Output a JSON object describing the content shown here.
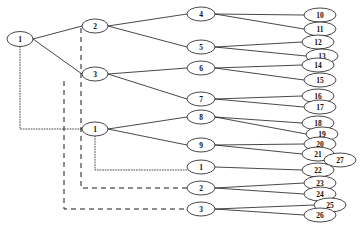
{
  "diagram": {
    "node_shape": "ellipse",
    "line_color": "#1a1a1a",
    "background": "#ffffff",
    "nodes": [
      {
        "id": "n1",
        "label": "1",
        "x": 20,
        "y": 39,
        "rx": 13,
        "ry": 7.5
      },
      {
        "id": "n2",
        "label": "2",
        "x": 95,
        "y": 26,
        "rx": 13,
        "ry": 7.0
      },
      {
        "id": "n3",
        "label": "3",
        "x": 95,
        "y": 74,
        "rx": 13,
        "ry": 7.0
      },
      {
        "id": "n1b",
        "label": "1",
        "x": 95,
        "y": 129,
        "rx": 13,
        "ry": 7.0
      },
      {
        "id": "n4",
        "label": "4",
        "x": 201,
        "y": 14,
        "rx": 14,
        "ry": 7.0
      },
      {
        "id": "n5",
        "label": "5",
        "x": 201,
        "y": 47,
        "rx": 14,
        "ry": 7.0
      },
      {
        "id": "n6",
        "label": "6",
        "x": 201,
        "y": 68,
        "rx": 14,
        "ry": 7.0
      },
      {
        "id": "n7",
        "label": "7",
        "x": 201,
        "y": 99,
        "rx": 14,
        "ry": 7.0
      },
      {
        "id": "n8",
        "label": "8",
        "x": 201,
        "y": 117,
        "rx": 14,
        "ry": 7.0
      },
      {
        "id": "n9",
        "label": "9",
        "x": 201,
        "y": 145,
        "rx": 14,
        "ry": 7.0
      },
      {
        "id": "n1c",
        "label": "1",
        "x": 201,
        "y": 167,
        "rx": 14,
        "ry": 7.0
      },
      {
        "id": "n2b",
        "label": "2",
        "x": 201,
        "y": 188,
        "rx": 14,
        "ry": 7.0
      },
      {
        "id": "n3b",
        "label": "3",
        "x": 201,
        "y": 209,
        "rx": 14,
        "ry": 7.0
      },
      {
        "id": "n10",
        "label": "10",
        "x": 320,
        "y": 15,
        "rx": 16,
        "ry": 7.0
      },
      {
        "id": "n11",
        "label": "11",
        "x": 320,
        "y": 29,
        "rx": 16,
        "ry": 7.0
      },
      {
        "id": "n12",
        "label": "12",
        "x": 318,
        "y": 42,
        "rx": 16,
        "ry": 7.0
      },
      {
        "id": "n13",
        "label": "13",
        "x": 322,
        "y": 56,
        "rx": 16,
        "ry": 7.0
      },
      {
        "id": "n14",
        "label": "14",
        "x": 318,
        "y": 65,
        "rx": 16,
        "ry": 7.0
      },
      {
        "id": "n15",
        "label": "15",
        "x": 320,
        "y": 80,
        "rx": 16,
        "ry": 7.0
      },
      {
        "id": "n16",
        "label": "16",
        "x": 318,
        "y": 96,
        "rx": 16,
        "ry": 7.0
      },
      {
        "id": "n17",
        "label": "17",
        "x": 320,
        "y": 107,
        "rx": 16,
        "ry": 7.0
      },
      {
        "id": "n18",
        "label": "18",
        "x": 318,
        "y": 123,
        "rx": 16,
        "ry": 7.0
      },
      {
        "id": "n19",
        "label": "19",
        "x": 322,
        "y": 134,
        "rx": 16,
        "ry": 7.0
      },
      {
        "id": "n20",
        "label": "20",
        "x": 320,
        "y": 144,
        "rx": 16,
        "ry": 7.0
      },
      {
        "id": "n21",
        "label": "21",
        "x": 318,
        "y": 154,
        "rx": 16,
        "ry": 7.0
      },
      {
        "id": "n27",
        "label": "27",
        "x": 340,
        "y": 160,
        "rx": 16,
        "ry": 7.0
      },
      {
        "id": "n22",
        "label": "22",
        "x": 318,
        "y": 170,
        "rx": 16,
        "ry": 7.0
      },
      {
        "id": "n23",
        "label": "23",
        "x": 320,
        "y": 183,
        "rx": 16,
        "ry": 7.0
      },
      {
        "id": "n24",
        "label": "24",
        "x": 320,
        "y": 194,
        "rx": 16,
        "ry": 7.0
      },
      {
        "id": "n25",
        "label": "25",
        "x": 330,
        "y": 205,
        "rx": 16,
        "ry": 7.0
      },
      {
        "id": "n26",
        "label": "26",
        "x": 320,
        "y": 215,
        "rx": 16,
        "ry": 7.0
      }
    ],
    "edges_solid": [
      {
        "from": "n1",
        "to": "n2"
      },
      {
        "from": "n1",
        "to": "n3"
      },
      {
        "from": "n2",
        "to": "n4"
      },
      {
        "from": "n2",
        "to": "n5"
      },
      {
        "from": "n3",
        "to": "n6"
      },
      {
        "from": "n3",
        "to": "n7"
      },
      {
        "from": "n1b",
        "to": "n8"
      },
      {
        "from": "n1b",
        "to": "n9"
      },
      {
        "from": "n4",
        "to": "n10"
      },
      {
        "from": "n4",
        "to": "n11"
      },
      {
        "from": "n5",
        "to": "n12"
      },
      {
        "from": "n5",
        "to": "n13"
      },
      {
        "from": "n6",
        "to": "n14"
      },
      {
        "from": "n6",
        "to": "n15"
      },
      {
        "from": "n7",
        "to": "n16"
      },
      {
        "from": "n7",
        "to": "n17"
      },
      {
        "from": "n8",
        "to": "n18"
      },
      {
        "from": "n8",
        "to": "n19"
      },
      {
        "from": "n9",
        "to": "n20"
      },
      {
        "from": "n9",
        "to": "n21"
      },
      {
        "from": "n21",
        "to": "n27"
      },
      {
        "from": "n1c",
        "to": "n22"
      },
      {
        "from": "n2b",
        "to": "n23"
      },
      {
        "from": "n2b",
        "to": "n24"
      },
      {
        "from": "n3b",
        "to": "n25"
      },
      {
        "from": "n3b",
        "to": "n26"
      }
    ],
    "edges_dotted": [
      {
        "from": "n1",
        "to": "n1b",
        "style": "orthogonal"
      },
      {
        "from": "n1b",
        "to": "n1c",
        "style": "orthogonal"
      }
    ],
    "edges_dashed": [
      {
        "from": "n2",
        "to": "n2b",
        "style": "orthogonal"
      },
      {
        "from": "n3",
        "to": "n3b",
        "style": "orthogonal"
      }
    ]
  }
}
